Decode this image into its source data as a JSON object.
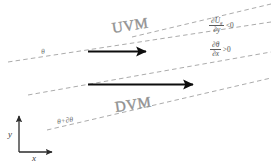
{
  "figure": {
    "title_regions": {
      "upper_region_label": "UVM",
      "lower_region_label": "DVM"
    },
    "isentrope_labels": {
      "upper": "θ",
      "lower": "θ+∂θ"
    },
    "conditions": [
      {
        "id": "wind-shear",
        "numerator": "∂U",
        "numerator_subscript": "g",
        "denominator": "∂y",
        "relation": "<0"
      },
      {
        "id": "theta-gradient",
        "numerator": "∂θ",
        "numerator_subscript": "",
        "denominator": "∂x",
        "relation": ">0"
      }
    ],
    "axes": {
      "x_label": "x",
      "y_label": "y"
    },
    "colors": {
      "dashed_line": "#8f8f8f",
      "arrow": "#0d0d0d",
      "region_text": "#8d8d8d",
      "math_text": "#4d4d4d",
      "axis": "#2b2b2b",
      "background": "#ffffff"
    },
    "arrows": [
      {
        "id": "upper-flow-arrow",
        "direction": "right"
      },
      {
        "id": "lower-flow-arrow",
        "direction": "right"
      }
    ],
    "dashed_lines_count": 4
  }
}
